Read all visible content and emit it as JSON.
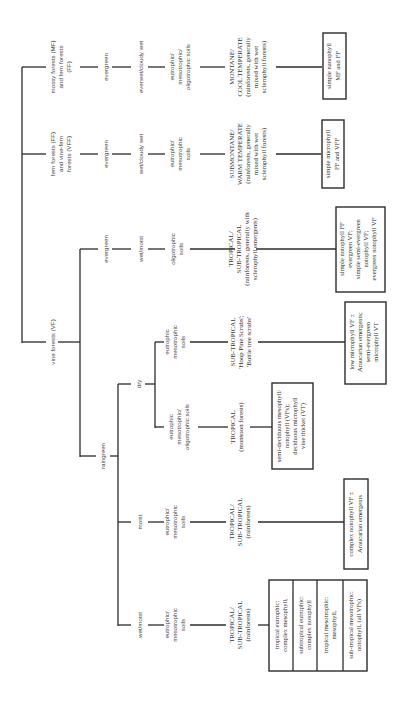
{
  "diagram": {
    "orientation": "rotated-90-ccw",
    "colors": {
      "line": "#2b2b2b",
      "text": "#333333",
      "background": "#ffffff"
    },
    "branches": {
      "mossy": {
        "forest_type": [
          "mossy forests (MF)",
          "and fern forests",
          "(FF)"
        ],
        "phenology": "evergreen",
        "moisture": "everwet/cloudy wet",
        "soils": [
          "eutrophic/",
          "mesotrophic/",
          "oligotrophic soils"
        ],
        "climate": [
          "MONTANE/",
          "COOL TEMPERATE",
          "(rainforests, generally",
          "mixed with wet",
          "sclerophyll forests)"
        ],
        "structure": [
          "simple nanophyll",
          "MF and FF"
        ]
      },
      "fern": {
        "forest_type": [
          "fern forests (FF)",
          "and vine-fern",
          "forests (VFF)"
        ],
        "phenology": "evergreen",
        "moisture": "wet/cloudy wet",
        "soils": [
          "eutrophic/",
          "mesotrophic",
          "soils"
        ],
        "climate": [
          "SUBMONTANE/",
          "WARM TEMPERATE",
          "(rainforests, generally",
          "mixed with wet",
          "sclerophyll forests)"
        ],
        "structure": [
          "simple microphyll",
          "FF and VFF"
        ]
      },
      "vine": {
        "forest_type": "vine forests (VF)",
        "evergreen": {
          "phenology": "evergreen",
          "moisture": "wet/moist",
          "soils": [
            "oligotrophic",
            "soils"
          ],
          "climate": [
            "TROPICAL/",
            "SUB-TROPICAL",
            "(rainforests, generally with",
            "sclerophyll emergents)"
          ],
          "structure": [
            "simple notophyll FF",
            "evergreen VF;",
            "simple semi-evergreen",
            "notophyll VF;",
            "evergreen notophyll VF"
          ]
        },
        "raingreen": {
          "phenology": "raingreen",
          "dry": {
            "moisture": "dry",
            "eutrophic": {
              "soils": [
                "eutrophic",
                "mesotrophic",
                "soils"
              ],
              "climate": [
                "SUB-TROPICAL",
                "'Hoop Pine Scrubs';",
                "'Bottle tree scrubs'"
              ],
              "structure": [
                "low microphyll VF ±",
                "Araucarian emergents;",
                "semi-evergreen",
                "microphyll VT"
              ]
            },
            "mixed": {
              "soils": [
                "eutrophic",
                "mesotrophic/",
                "oligotrophic soils"
              ],
              "climate": [
                "TROPICAL",
                "(monsoon forests)"
              ],
              "structure": [
                "semi-deciduous mesophyll/",
                "notophyll (VFs);",
                "deciduous microphyll",
                "vine thicket (VT)"
              ]
            }
          },
          "moist": {
            "moisture": "moist",
            "soils": [
              "eutrophic/",
              "mesotrophic",
              "soils"
            ],
            "climate": [
              "TROPICAL/",
              "SUB-TROPICAL",
              "(rainforests)"
            ],
            "structure": [
              "complex notophyll VF ±",
              "Araucarian emergents"
            ]
          },
          "wet": {
            "moisture": "wet/moist",
            "soils": [
              "eutrophic/",
              "mesotrophic",
              "soils"
            ],
            "climate": [
              "TROPICAL/",
              "SUB-TROPICAL",
              "(rainforests)"
            ],
            "structure_cells": [
              [
                "tropical eutrophic:",
                "complex mesophyll,"
              ],
              [
                "subtropical eutrophic:",
                "complex notophyll"
              ],
              [
                "tropical mesotrophic:",
                "mesophyll,"
              ],
              [
                "sub-tropical mesotrophic:",
                "notophyll, (all VFs)"
              ]
            ]
          }
        }
      }
    }
  }
}
